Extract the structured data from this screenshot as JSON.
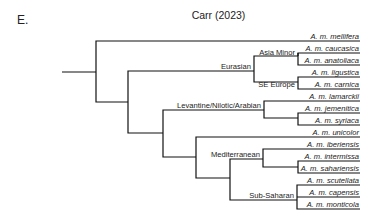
{
  "panel_label": "E.",
  "title": "Carr (2023)",
  "taxa": [
    {
      "name": "A. m. mellifera",
      "y": 41
    },
    {
      "name": "A. m. caucasica",
      "y": 53
    },
    {
      "name": "A. m. anatoliaca",
      "y": 65
    },
    {
      "name": "A. m. ligustica",
      "y": 77
    },
    {
      "name": "A. m. carnica",
      "y": 89
    },
    {
      "name": "A. m. lamarckii",
      "y": 101
    },
    {
      "name": "A. m. jemenitica",
      "y": 113
    },
    {
      "name": "A. m. syriaca",
      "y": 125
    },
    {
      "name": "A. m. unicolor",
      "y": 137
    },
    {
      "name": "A. m. iberiensis",
      "y": 149
    },
    {
      "name": "A. m. intermissa",
      "y": 161
    },
    {
      "name": "A. m. sahariensis",
      "y": 173
    },
    {
      "name": "A. m. scutellata",
      "y": 185
    },
    {
      "name": "A. m. capensis",
      "y": 197
    },
    {
      "name": "A. m. monticola",
      "y": 209
    }
  ],
  "clades": [
    {
      "name": "Asia Minor",
      "x": 296,
      "y": 51
    },
    {
      "name": "Eurasian",
      "x": 252,
      "y": 69
    },
    {
      "name": "SE Europe",
      "x": 296,
      "y": 87
    },
    {
      "name": "Levantine/Nilotic/Arabian",
      "x": 262,
      "y": 112
    },
    {
      "name": "Mediterranean",
      "x": 261,
      "y": 164
    },
    {
      "name": "Sub-Saharan",
      "x": 295,
      "y": 198
    }
  ],
  "colors": {
    "line": "#111111",
    "text": "#222222",
    "background": "#ffffff"
  }
}
